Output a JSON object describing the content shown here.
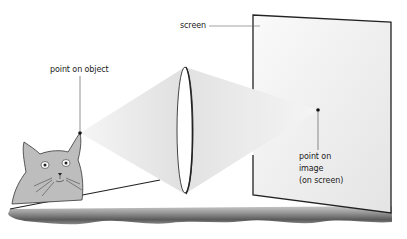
{
  "diagram": {
    "type": "optics-lens-image-formation",
    "labels": {
      "point_on_object": "point on object",
      "screen": "screen",
      "point_on_image_line1": "point on",
      "point_on_image_line2": "image",
      "point_on_image_line3": "(on screen)"
    },
    "elements": {
      "object": "cat",
      "lens": "convex lens",
      "screen": "projection screen",
      "base": "bench surface"
    },
    "colors": {
      "background": "#ffffff",
      "cone_light": "#e6e6e6",
      "screen_fill": "#efefef",
      "outline": "#222222",
      "cat_fill": "#bdbdbd",
      "base_dark": "#555555",
      "base_light": "#aaaaaa"
    }
  }
}
